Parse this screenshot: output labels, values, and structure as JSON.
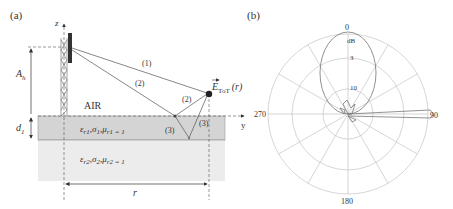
{
  "panel_a": {
    "label": "(a)",
    "z_axis": "z",
    "y_axis": "y",
    "height_label": "A",
    "height_sub": "h",
    "depth_label": "d",
    "depth_sub": "1",
    "air_label": "AIR",
    "distance_label": "r",
    "path_1": "(1)",
    "path_2a": "(2)",
    "path_2b": "(2)",
    "path_3a": "(3)",
    "path_3b": "(3)",
    "field_label": "E",
    "field_sub": "ToT",
    "field_arg": "(r)",
    "layer1": {
      "eps": "ε",
      "eps_sub": "r1",
      "sigma": "σ",
      "sigma_sub": "1",
      "mu": "μ",
      "mu_sub": "r1 = 1",
      "color": "#d4d4d4"
    },
    "layer2": {
      "eps": "ε",
      "eps_sub": "r2",
      "sigma": "σ",
      "sigma_sub": "2",
      "mu": "μ",
      "mu_sub": "r2 = 1",
      "color": "#ececec"
    }
  },
  "panel_b": {
    "label": "(b)",
    "angle_top": "0",
    "angle_right": "90",
    "angle_bottom": "180",
    "angle_left": "270",
    "unit": "dB",
    "ring_3": "3",
    "ring_10": "10"
  }
}
